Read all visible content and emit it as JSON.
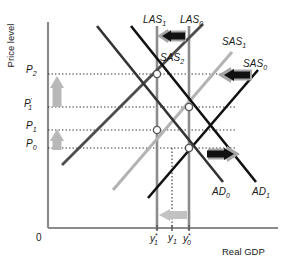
{
  "figure": {
    "axes": {
      "y_label": "Price level",
      "x_label": "Real GDP",
      "origin_label": "0"
    },
    "y_ticks": [
      {
        "id": "p2",
        "text": "P",
        "sub": "2",
        "sup": "",
        "y": 71
      },
      {
        "id": "p1p",
        "text": "P",
        "sub": "1",
        "sup": "'",
        "y": 104
      },
      {
        "id": "p1",
        "text": "P",
        "sub": "1",
        "sup": "",
        "y": 127
      },
      {
        "id": "p0",
        "text": "P",
        "sub": "0",
        "sup": "",
        "y": 145
      }
    ],
    "x_ticks": [
      {
        "id": "y1star",
        "text": "y",
        "sub": "1",
        "sup": "*",
        "x": 156
      },
      {
        "id": "y1",
        "text": "y",
        "sub": "1",
        "sup": "",
        "x": 172
      },
      {
        "id": "y0star",
        "text": "y",
        "sub": "0",
        "sup": "*",
        "x": 188
      }
    ],
    "curves": [
      {
        "id": "las1",
        "label": "LAS",
        "sub": "1",
        "color": "#8c8c8c",
        "type": "vertical"
      },
      {
        "id": "las0",
        "label": "LAS",
        "sub": "0",
        "color": "#8c8c8c",
        "type": "vertical"
      },
      {
        "id": "sas2",
        "label": "SAS",
        "sub": "2",
        "color": "#4d4d4d",
        "type": "upward"
      },
      {
        "id": "sas1",
        "label": "SAS",
        "sub": "1",
        "color": "#b3b3b3",
        "type": "upward"
      },
      {
        "id": "sas0",
        "label": "SAS",
        "sub": "0",
        "color": "#111111",
        "type": "upward"
      },
      {
        "id": "ad0",
        "label": "AD",
        "sub": "0",
        "color": "#333333",
        "type": "downward"
      },
      {
        "id": "ad1",
        "label": "AD",
        "sub": "1",
        "color": "#111111",
        "type": "downward"
      }
    ],
    "shift_arrows": [
      {
        "id": "las-shift-arrow",
        "direction": "left",
        "meaning": "LAS shifts left"
      },
      {
        "id": "sas-shift-arrow",
        "direction": "left",
        "meaning": "SAS shifts left"
      },
      {
        "id": "ad-shift-arrow",
        "direction": "right",
        "meaning": "AD shifts right"
      },
      {
        "id": "price-rise-arrow-upper",
        "direction": "up",
        "meaning": "Price level rises"
      },
      {
        "id": "price-rise-arrow-lower",
        "direction": "up",
        "meaning": "Price level rises"
      },
      {
        "id": "output-fall-arrow",
        "direction": "left",
        "meaning": "Potential output falls"
      }
    ],
    "colors": {
      "axis": "#8c8c8c",
      "dotted": "#333333",
      "arrow_black": "#111111",
      "arrow_gray": "#a6a6a6",
      "las_gray": "#8c8c8c",
      "sas2": "#4d4d4d",
      "sas1": "#b3b3b3",
      "sas0": "#111111",
      "ad0": "#333333",
      "ad1": "#111111",
      "background": "#ffffff"
    }
  }
}
